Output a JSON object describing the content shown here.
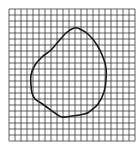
{
  "diagram": {
    "type": "grid-with-irregular-shape",
    "background": "#ffffff",
    "grid": {
      "x": 9,
      "y": 9,
      "columns": 21,
      "rows": 22,
      "cell_size": 6,
      "line_color": "#3a3a3a",
      "line_width": 0.8
    },
    "shape": {
      "stroke": "#1a1a1a",
      "stroke_width": 1.6,
      "fill": "none",
      "points": [
        [
          74,
          28
        ],
        [
          80,
          29
        ],
        [
          89,
          35
        ],
        [
          97,
          45
        ],
        [
          103,
          57
        ],
        [
          106,
          68
        ],
        [
          106,
          80
        ],
        [
          104,
          92
        ],
        [
          98,
          104
        ],
        [
          89,
          112
        ],
        [
          84,
          114
        ],
        [
          72,
          116
        ],
        [
          62,
          117
        ],
        [
          55,
          113
        ],
        [
          48,
          108
        ],
        [
          41,
          103
        ],
        [
          35,
          99
        ],
        [
          32,
          93
        ],
        [
          31,
          85
        ],
        [
          31,
          75
        ],
        [
          35,
          65
        ],
        [
          42,
          57
        ],
        [
          51,
          50
        ],
        [
          58,
          42
        ],
        [
          66,
          33
        ]
      ]
    }
  }
}
